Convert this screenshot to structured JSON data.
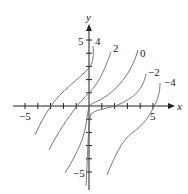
{
  "chart_data": {
    "type": "line",
    "title": "",
    "xlabel": "x",
    "ylabel": "y",
    "xlim": [
      -6,
      6.5
    ],
    "ylim": [
      -6,
      6
    ],
    "grid": false,
    "x_tick_labels": [
      {
        "value": -5,
        "label": "−5"
      },
      {
        "value": 5,
        "label": "5"
      }
    ],
    "y_tick_labels": [
      {
        "value": 5,
        "label": "5"
      },
      {
        "value": -5,
        "label": "−5"
      }
    ],
    "x_ticks": [
      -5,
      -4,
      -3,
      -2,
      -1,
      1,
      2,
      3,
      4,
      5
    ],
    "y_ticks": [
      -5,
      -4,
      -3,
      -2,
      -1,
      1,
      2,
      3,
      4,
      5
    ],
    "series_description": "Family of solution curves (level curves) labeled by constant C",
    "series": [
      {
        "name": "4",
        "label": "4",
        "points": [
          [
            0.3,
            4.6
          ],
          [
            0.2,
            3.0
          ],
          [
            -1.0,
            2.0
          ],
          [
            -3.0,
            0.0
          ],
          [
            -4.3,
            -2.2
          ]
        ]
      },
      {
        "name": "2",
        "label": "2",
        "points": [
          [
            1.7,
            4.0
          ],
          [
            0.9,
            2.0
          ],
          [
            0.0,
            1.0
          ],
          [
            -1.0,
            0.0
          ],
          [
            -2.4,
            -2.2
          ],
          [
            -3.1,
            -3.3
          ]
        ]
      },
      {
        "name": "0",
        "label": "0",
        "points": [
          [
            3.8,
            4.2
          ],
          [
            2.2,
            2.2
          ],
          [
            1.0,
            1.0
          ],
          [
            0.0,
            0.0
          ],
          [
            -0.6,
            -2.5
          ],
          [
            -1.9,
            -5.0
          ]
        ]
      },
      {
        "name": "-2",
        "label": "−2",
        "points": [
          [
            4.5,
            2.3
          ],
          [
            3.8,
            1.0
          ],
          [
            2.0,
            0.0
          ],
          [
            0.6,
            -0.4
          ],
          [
            0.1,
            -1.5
          ],
          [
            -0.3,
            -6.0
          ]
        ]
      },
      {
        "name": "-4",
        "label": "−4",
        "points": [
          [
            5.6,
            1.7
          ],
          [
            5.1,
            0.0
          ],
          [
            3.4,
            -2.0
          ],
          [
            1.7,
            -5.0
          ]
        ]
      }
    ]
  }
}
